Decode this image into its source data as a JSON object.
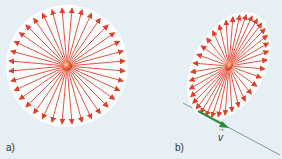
{
  "panels": [
    {
      "id": "a",
      "label": "a)",
      "description": "Stationary charge: radial field lines uniformly distributed in a circle"
    },
    {
      "id": "b",
      "label": "b)",
      "description": "Moving charge: field lines compressed into a tilted ellipse, perpendicular to velocity"
    }
  ],
  "velocity": {
    "label": "v",
    "color": "#2e8b3e"
  },
  "colors": {
    "background": "#e6eff4",
    "field_disc": "#ffffff",
    "field_line": "#e0402a",
    "charge": "#f06a3a",
    "velocity_line": "#6a7f8a"
  },
  "field_line_count": 36
}
